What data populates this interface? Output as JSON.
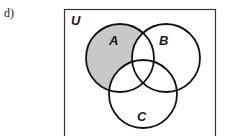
{
  "part_label": "d)",
  "diagram": {
    "type": "venn",
    "universe_label": "U",
    "sets": [
      {
        "name": "A",
        "cx": 120,
        "cy": 58,
        "r": 34,
        "label_x": 113,
        "label_y": 42
      },
      {
        "name": "B",
        "cx": 166,
        "cy": 58,
        "r": 34,
        "label_x": 164,
        "label_y": 42
      },
      {
        "name": "C",
        "cx": 143,
        "cy": 94,
        "r": 34,
        "label_x": 141,
        "label_y": 119
      }
    ],
    "shaded_region": "A only (A minus B minus C)",
    "colors": {
      "shade": "#c8c8c8",
      "stroke": "#111111",
      "background": "#ffffff"
    }
  }
}
